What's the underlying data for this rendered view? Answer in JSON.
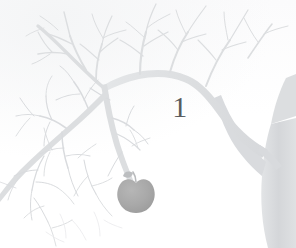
{
  "page": {
    "kind": "chapter-opener",
    "background_color": "#ffffff",
    "paper_tint_color": "#f4f5f6"
  },
  "chapter": {
    "number": "1"
  },
  "illustration": {
    "subject": "apple-tree",
    "style": "pale grey silhouette",
    "branch_color": "#dcdee0",
    "branch_color_light": "#e6e8ea",
    "twig_color": "#d8dadd",
    "trunk_color": "#d5d7da",
    "apple": {
      "label": "apple",
      "color": "#a8a8a8",
      "stem_color": "#b9bbbd",
      "count": 1
    },
    "elements": [
      {
        "name": "trunk",
        "position": "top-right"
      },
      {
        "name": "main-bough-left",
        "position": "upper-left"
      },
      {
        "name": "main-bough-lower-left",
        "position": "lower-left"
      },
      {
        "name": "hanging-branch",
        "position": "center-left"
      },
      {
        "name": "apple",
        "position": "lower-center-left"
      }
    ]
  }
}
